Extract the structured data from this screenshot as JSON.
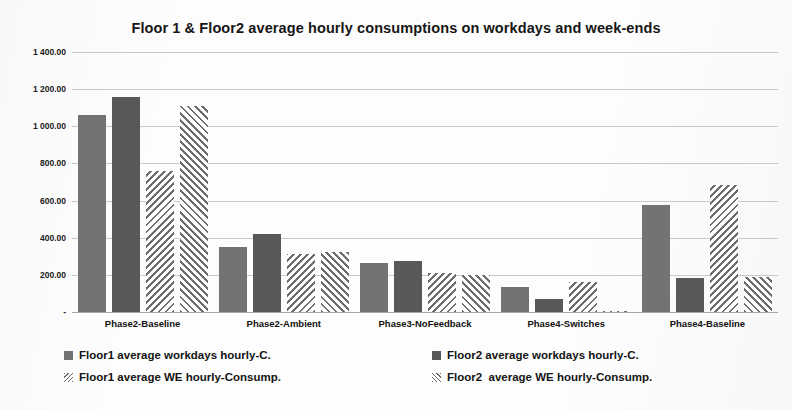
{
  "chart_data": {
    "type": "bar",
    "title": "Floor 1 & Floor2 average hourly consumptions on workdays and week-ends",
    "xlabel": "",
    "ylabel": "",
    "ylim": [
      0,
      1400
    ],
    "ytick_step": 200,
    "grid": true,
    "legend_position": "bottom",
    "ytick_labels": [
      "1 400.00",
      "1 200.00",
      "1 000.00",
      "800.00",
      "600.00",
      "400.00",
      "200.00",
      "-"
    ],
    "ytick_values": [
      1400,
      1200,
      1000,
      800,
      600,
      400,
      200,
      0
    ],
    "categories": [
      "Phase2-Baseline",
      "Phase2-Ambient",
      "Phase3-NoFeedback",
      "Phase4-Switches",
      "Phase4-Baseline"
    ],
    "series": [
      {
        "name": "Floor1 average workdays hourly-C.",
        "style": "solid-medium-gray",
        "color": "#737373",
        "values": [
          1060,
          352,
          265,
          133,
          578
        ]
      },
      {
        "name": "Floor2 average workdays hourly-C.",
        "style": "solid-dark-gray",
        "color": "#585858",
        "values": [
          1158,
          420,
          277,
          68,
          183
        ]
      },
      {
        "name": "Floor1 average WE hourly-Consump.",
        "style": "hatch-backslash",
        "color": "#6d6d6d",
        "values": [
          757,
          313,
          208,
          160,
          683
        ]
      },
      {
        "name": "Floor2  average WE hourly-Consump.",
        "style": "hatch-slash",
        "color": "#6d6d6d",
        "values": [
          1110,
          322,
          198,
          6,
          188
        ]
      }
    ]
  },
  "legend": {
    "entries": [
      "Floor1 average workdays hourly-C.",
      "Floor1 average WE hourly-Consump.",
      "Floor2 average workdays hourly-C.",
      "Floor2  average WE hourly-Consump."
    ]
  }
}
